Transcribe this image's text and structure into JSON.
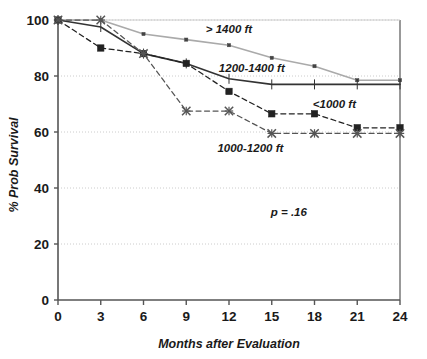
{
  "chart_data": {
    "type": "line",
    "title": "",
    "xlabel": "Months after Evaluation",
    "ylabel": "% Prob Survival",
    "x": [
      0,
      3,
      6,
      9,
      12,
      15,
      18,
      21,
      24
    ],
    "xlim": [
      0,
      24
    ],
    "ylim": [
      0,
      100
    ],
    "xticks": [
      "0",
      "3",
      "6",
      "9",
      "12",
      "15",
      "18",
      "21",
      "24"
    ],
    "yticks": [
      "0",
      "20",
      "40",
      "60",
      "80",
      "100"
    ],
    "grid": "horizontal-dotted",
    "legend": "inline-labels",
    "annotations": [
      {
        "text": "p = .16",
        "x": 16.2,
        "y": 30
      }
    ],
    "series": [
      {
        "name": "> 1400 ft",
        "label": "> 1400 ft",
        "style": "solid",
        "color": "#aaaaaa",
        "marker": "small-square",
        "label_x": 12.0,
        "label_y": 95.5,
        "values": [
          100,
          100,
          95,
          93,
          91,
          86.5,
          83.5,
          78.5,
          78.5
        ]
      },
      {
        "name": "1200-1400 ft",
        "label": "1200-1400 ft",
        "style": "solid",
        "color": "#333333",
        "marker": "tick",
        "label_x": 13.6,
        "label_y": 81.5,
        "values": [
          100,
          97.5,
          88,
          84.5,
          79,
          77,
          77,
          77,
          77
        ]
      },
      {
        "name": "<1000 ft",
        "label": "<1000 ft",
        "style": "dashed",
        "color": "#222222",
        "marker": "square",
        "label_x": 19.4,
        "label_y": 68.5,
        "values": [
          100,
          90,
          88,
          84.5,
          74.5,
          66.5,
          66.5,
          61.5,
          61.5
        ]
      },
      {
        "name": "1000-1200 ft",
        "label": "1000-1200 ft",
        "style": "dashed",
        "color": "#555555",
        "marker": "x-star",
        "label_x": 13.5,
        "label_y": 53.0,
        "values": [
          100,
          100,
          88,
          67.5,
          67.5,
          59.5,
          59.5,
          59.5,
          59.5
        ]
      }
    ],
    "colors": {
      "axis": "#555555",
      "grid": "#cccccc",
      "text": "#1a1a1a",
      "series_light_gray": "#aaaaaa",
      "series_dark": "#333333"
    }
  }
}
